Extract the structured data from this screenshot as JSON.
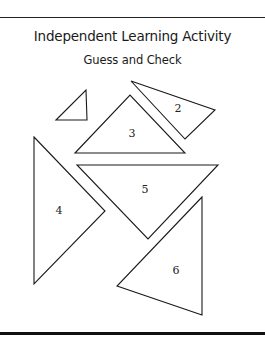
{
  "header": {
    "title": "Independent Learning Activity",
    "subtitle": "Guess and Check"
  },
  "figure": {
    "shape_type": "triangle",
    "triangles": [
      {
        "label": "",
        "points": "56,120 86,90 87,120",
        "label_x": 0,
        "label_y": 0
      },
      {
        "label": "2",
        "points": "131,81 215,110 185,139",
        "label_x": 178,
        "label_y": 112
      },
      {
        "label": "3",
        "points": "75,153 130,95 185,153",
        "label_x": 132,
        "label_y": 137
      },
      {
        "label": "4",
        "points": "34,137 105,211 34,284",
        "label_x": 59,
        "label_y": 214
      },
      {
        "label": "5",
        "points": "77,165 218,165 148,239",
        "label_x": 145,
        "label_y": 193
      },
      {
        "label": "6",
        "points": "202,197 117,286 202,315",
        "label_x": 176,
        "label_y": 274
      }
    ]
  }
}
